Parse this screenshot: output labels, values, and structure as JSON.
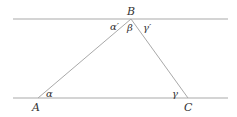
{
  "diagram": {
    "type": "geometry-parallel-lines-triangle",
    "colors": {
      "line": "#a9a9a9",
      "text": "#333333"
    },
    "parallel_lines": [
      {
        "name": "top",
        "x1": 13,
        "y1": 19,
        "x2": 228,
        "y2": 19
      },
      {
        "name": "bottom",
        "x1": 13,
        "y1": 98,
        "x2": 228,
        "y2": 98
      }
    ],
    "vertices": {
      "A": {
        "label": "A",
        "x": 38,
        "y": 98
      },
      "B": {
        "label": "B",
        "x": 131,
        "y": 19
      },
      "C": {
        "label": "C",
        "x": 188,
        "y": 98
      }
    },
    "angle_labels": {
      "alpha": "α",
      "alpha_prime": "α′",
      "beta": "β",
      "gamma": "γ",
      "gamma_prime": "γ′"
    }
  }
}
